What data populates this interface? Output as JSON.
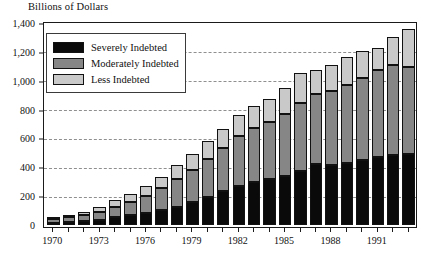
{
  "figure": {
    "axis_title": "Billions of Dollars"
  },
  "legend": {
    "items": [
      {
        "label": "Severely Indebted",
        "color": "#0a0a0a",
        "key": "severely"
      },
      {
        "label": "Moderately Indebted",
        "color": "#868686",
        "key": "moderately"
      },
      {
        "label": "Less Indebted",
        "color": "#c9c9c9",
        "key": "less"
      }
    ]
  },
  "chart_data": {
    "type": "bar",
    "stacked": true,
    "title": "",
    "subtitle": "",
    "xlabel": "",
    "ylabel": "Billions of Dollars",
    "grid": true,
    "legend_position": "top-left-inside",
    "ylim": [
      0,
      1400
    ],
    "yticks": [
      0,
      200,
      400,
      600,
      800,
      1000,
      1200,
      1400
    ],
    "ytick_labels": [
      "0",
      "200",
      "400",
      "600",
      "800",
      "1,000",
      "1,200",
      "1,400"
    ],
    "categories": [
      "1970",
      "1971",
      "1972",
      "1973",
      "1974",
      "1975",
      "1976",
      "1977",
      "1978",
      "1979",
      "1980",
      "1981",
      "1982",
      "1983",
      "1984",
      "1985",
      "1986",
      "1987",
      "1988",
      "1989",
      "1990",
      "1991",
      "1992",
      "1993"
    ],
    "xtick_labels": [
      "1970",
      "1973",
      "1976",
      "1979",
      "1982",
      "1985",
      "1988",
      "1991"
    ],
    "xtick_categories": [
      "1970",
      "1973",
      "1976",
      "1979",
      "1982",
      "1985",
      "1988",
      "1991"
    ],
    "series": [
      {
        "name": "Severely Indebted",
        "color": "#0a0a0a",
        "values": [
          20,
          25,
          30,
          40,
          55,
          70,
          85,
          105,
          130,
          160,
          195,
          235,
          275,
          300,
          320,
          340,
          375,
          425,
          420,
          430,
          455,
          470,
          485,
          490
        ]
      },
      {
        "name": "Moderately Indebted",
        "color": "#868686",
        "values": [
          25,
          30,
          40,
          55,
          75,
          95,
          120,
          150,
          190,
          225,
          265,
          300,
          340,
          370,
          395,
          430,
          470,
          480,
          505,
          540,
          565,
          600,
          620,
          605
        ]
      },
      {
        "name": "Less Indebted",
        "color": "#c9c9c9",
        "values": [
          15,
          20,
          25,
          35,
          45,
          55,
          65,
          80,
          95,
          105,
          120,
          130,
          145,
          155,
          160,
          180,
          210,
          170,
          185,
          190,
          185,
          155,
          195,
          260
        ]
      }
    ],
    "totals": [
      60,
      75,
      95,
      130,
      175,
      220,
      270,
      335,
      415,
      490,
      580,
      665,
      760,
      825,
      875,
      950,
      1055,
      1075,
      1110,
      1160,
      1205,
      1225,
      1300,
      1355
    ]
  }
}
